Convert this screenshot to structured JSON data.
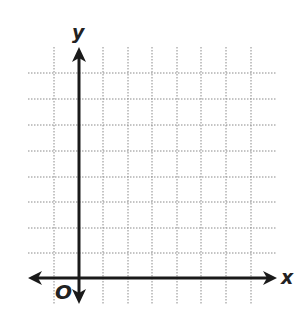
{
  "diagram": {
    "type": "coordinate-grid",
    "axes": {
      "x_label": "x",
      "y_label": "y",
      "origin_label": "O"
    },
    "grid": {
      "style": "dotted",
      "columns": 10,
      "rows": 9,
      "line_color": "#8a8a8a",
      "axis_color": "#1a1a1a"
    }
  }
}
